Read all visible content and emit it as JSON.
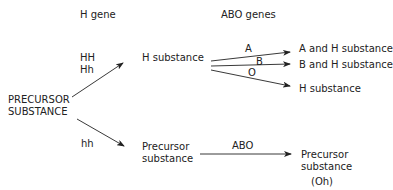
{
  "headers": {
    "h_gene": "H gene",
    "abo_genes": "ABO genes"
  },
  "source": {
    "line1": "PRECURSOR",
    "line2": "SUBSTANCE"
  },
  "genotypes": {
    "hh_dominant_1": "HH",
    "hh_dominant_2": "Hh",
    "hh_recessive": "hh"
  },
  "intermediates": {
    "h_substance": "H substance",
    "precursor_line1": "Precursor",
    "precursor_line2": "substance"
  },
  "abo_labels": {
    "a": "A",
    "b": "B",
    "o": "O",
    "abo": "ABO"
  },
  "products": {
    "a_and_h": "A and H substance",
    "b_and_h": "B and H substance",
    "h_only": "H substance",
    "precursor_line1": "Precursor",
    "precursor_line2": "substance",
    "oh": "(Oh)"
  }
}
